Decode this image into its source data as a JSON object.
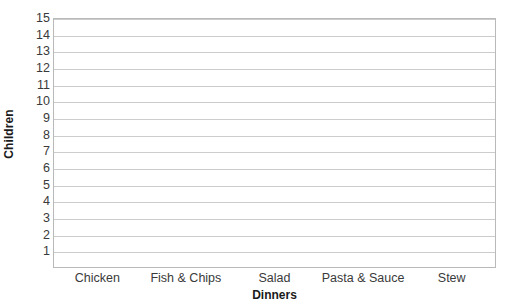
{
  "chart_data": {
    "type": "bar",
    "title": "",
    "subtitle": "",
    "xlabel": "Dinners",
    "ylabel": "Children",
    "categories": [
      "Chicken",
      "Fish & Chips",
      "Salad",
      "Pasta & Sauce",
      "Stew"
    ],
    "values": [
      null,
      null,
      null,
      null,
      null
    ],
    "series": [],
    "ylim": [
      0,
      15
    ],
    "ytick_labels": [
      "15",
      "14",
      "13",
      "12",
      "11",
      "10",
      "9",
      "8",
      "7",
      "6",
      "5",
      "4",
      "3",
      "2",
      "1"
    ],
    "ytick_values": [
      15,
      14,
      13,
      12,
      11,
      10,
      9,
      8,
      7,
      6,
      5,
      4,
      3,
      2,
      1
    ],
    "grid": "horizontal",
    "legend": "none",
    "annotations": [],
    "note": "empty chart template - no bars drawn",
    "colors": {
      "background": "#ffffff",
      "plot_border": "#b9b9b9",
      "gridline": "#cccccc",
      "tick_text": "#3a3a3a",
      "axis_title_text": "#1a1a1a"
    }
  }
}
